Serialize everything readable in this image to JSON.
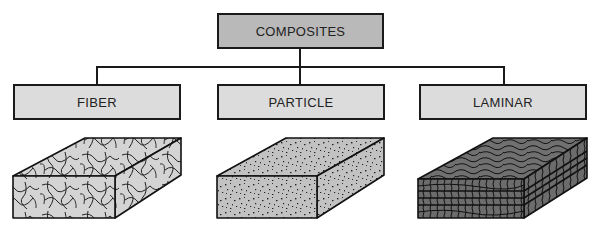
{
  "diagram": {
    "root": {
      "label": "COMPOSITES",
      "fill": "#b9b9b9"
    },
    "children": [
      {
        "label": "FIBER",
        "fill": "#dcdcdc",
        "texture": "random-fibers"
      },
      {
        "label": "PARTICLE",
        "fill": "#dcdcdc",
        "texture": "dispersed-particles"
      },
      {
        "label": "LAMINAR",
        "fill": "#dcdcdc",
        "texture": "layered-wood-grain"
      }
    ],
    "colors": {
      "line": "#1a1a1a",
      "fiber_block": "#d4d4d4",
      "particle_block": "#bdbdbd",
      "laminar_block": "#707070"
    }
  }
}
